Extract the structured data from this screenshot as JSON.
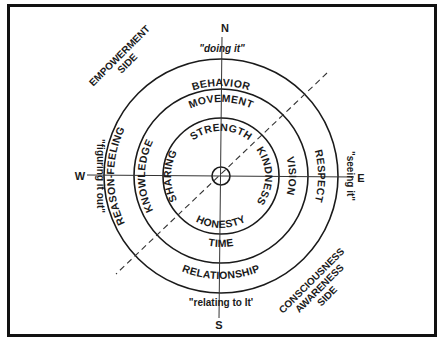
{
  "diagram": {
    "type": "concentric-medicine-wheel",
    "directions": {
      "north": "N",
      "south": "S",
      "east": "E",
      "west": "W"
    },
    "quotes": {
      "north": "\"doing it\"",
      "south": "\"relating to It'",
      "east": "\"seeing it\"",
      "west": "\"figuring it out\""
    },
    "sides": {
      "empowerment": {
        "line1": "EMPOWERMENT",
        "line2": "SIDE"
      },
      "consciousness": {
        "line1": "CONSCIOUSNESS",
        "line2": "AWARENESS",
        "line3": "SIDE"
      }
    },
    "rings": {
      "outer": {
        "north": "BEHAVIOR",
        "south": "RELATIONSHIP",
        "east": "RESPECT",
        "west": "REASON-FEELING"
      },
      "middle": {
        "north": "MOVEMENT",
        "south": "TIME",
        "east": "VISION",
        "west": "KNOWLEDGE"
      },
      "inner": {
        "north": "STRENGTH",
        "south": "HONESTY",
        "east": "KINDNESS",
        "west": "SHARING"
      }
    },
    "colors": {
      "line": "#1a1a1a",
      "background": "#ffffff"
    }
  }
}
